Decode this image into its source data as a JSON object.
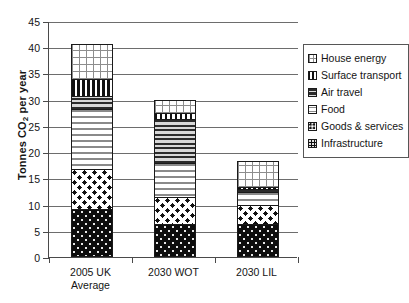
{
  "chart_data": {
    "type": "bar",
    "subtype": "stacked",
    "title": "",
    "xlabel": "",
    "ylabel": "Tonnes CO2 per year",
    "ylabel_parts": {
      "pre": "Tonnes CO",
      "sub": "2",
      "post": " per year"
    },
    "ylim": [
      0,
      45
    ],
    "ytick_step": 5,
    "yticks": [
      0,
      5,
      10,
      15,
      20,
      25,
      30,
      35,
      40,
      45
    ],
    "grid": "horizontal",
    "legend_position": "right",
    "categories": [
      "2005 UK Average",
      "2030 WOT",
      "2030 LIL"
    ],
    "category_lines": [
      [
        "2005 UK",
        "Average"
      ],
      [
        "2030 WOT"
      ],
      [
        "2030 LIL"
      ]
    ],
    "series": [
      {
        "name": "Infrastructure",
        "pattern": "dotted-black",
        "values": [
          8.8,
          6.0,
          6.0
        ]
      },
      {
        "name": "Goods & services",
        "pattern": "large-dots",
        "values": [
          7.6,
          5.0,
          3.5
        ]
      },
      {
        "name": "Food",
        "pattern": "small-dashes",
        "values": [
          11.4,
          6.5,
          2.5
        ]
      },
      {
        "name": "Air travel",
        "pattern": "horizontal-lines",
        "values": [
          2.6,
          8.5,
          0.5
        ]
      },
      {
        "name": "Surface transport",
        "pattern": "vertical-stripes",
        "values": [
          3.2,
          1.0,
          0.5
        ]
      },
      {
        "name": "House energy",
        "pattern": "grid-crosshatch",
        "values": [
          6.6,
          2.5,
          5.0
        ]
      }
    ],
    "totals": [
      40.2,
      29.5,
      18.0
    ],
    "legend_order": [
      "House energy",
      "Surface transport",
      "Air travel",
      "Food",
      "Goods & services",
      "Infrastructure"
    ]
  },
  "legend": {
    "items": [
      {
        "label": "House energy",
        "swatch": "grid-crosshatch-swatch"
      },
      {
        "label": "Surface transport",
        "swatch": "vertical-stripes-swatch"
      },
      {
        "label": "Air travel",
        "swatch": "horizontal-lines-swatch"
      },
      {
        "label": "Food",
        "swatch": "small-dashes-swatch"
      },
      {
        "label": "Goods & services",
        "swatch": "large-dots-swatch"
      },
      {
        "label": "Infrastructure",
        "swatch": "dotted-black-swatch"
      }
    ]
  },
  "colors": {
    "axis": "#4a4a4a",
    "gridline": "#6d6d6d",
    "bar_outline": "#1a1a1a",
    "background": "#ffffff",
    "text": "#141414"
  }
}
